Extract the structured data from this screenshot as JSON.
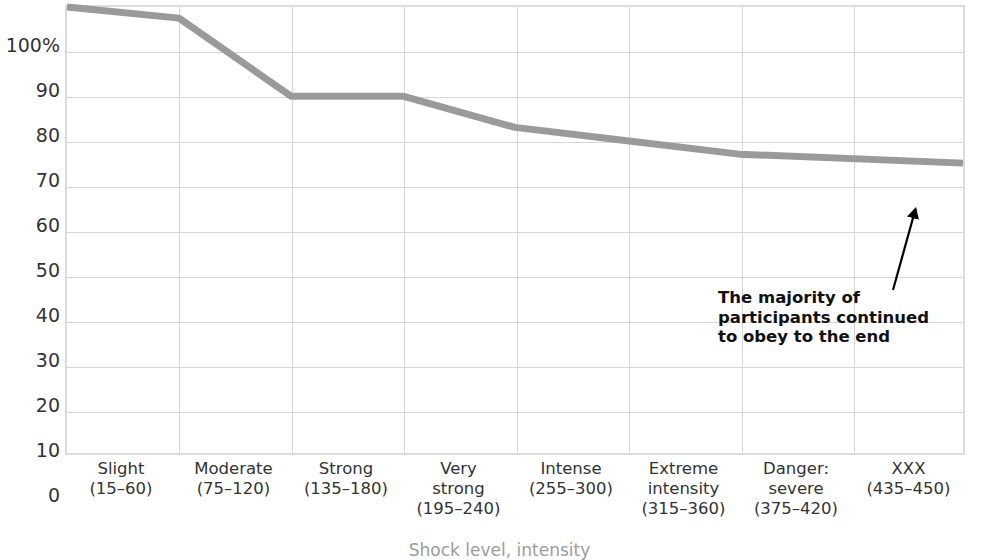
{
  "chart_data": {
    "type": "line",
    "title": "",
    "xlabel": "Shock level, intensity",
    "ylabel": "",
    "grid": true,
    "legend": "none",
    "ylim": [
      0,
      100
    ],
    "yticks": [
      "0",
      "10",
      "20",
      "30",
      "40",
      "50",
      "60",
      "70",
      "80",
      "90",
      "100%"
    ],
    "ytick_values": [
      0,
      10,
      20,
      30,
      40,
      50,
      60,
      70,
      80,
      90,
      100
    ],
    "categories": [
      "Slight (15–60)",
      "Moderate (75–120)",
      "Strong (135–180)",
      "Very strong (195–240)",
      "Intense (255–300)",
      "Extreme intensity (315–360)",
      "Danger: severe (375–420)",
      "XXX (435–450)"
    ],
    "category_lines": [
      [
        "Slight",
        "(15–60)"
      ],
      [
        "Moderate",
        "(75–120)"
      ],
      [
        "Strong",
        "(135–180)"
      ],
      [
        "Very",
        "strong",
        "(195–240)"
      ],
      [
        "Intense",
        "(255–300)"
      ],
      [
        "Extreme",
        "intensity",
        "(315–360)"
      ],
      [
        "Danger:",
        "severe",
        "(375–420)"
      ],
      [
        "XXX",
        "(435–450)"
      ]
    ],
    "values": [
      100,
      97.5,
      80,
      80,
      73,
      70,
      67,
      65
    ],
    "series": [
      {
        "name": "Participants still obeying",
        "values": [
          100,
          97.5,
          80,
          80,
          73,
          70,
          67,
          65
        ]
      }
    ],
    "annotations": [
      {
        "lines": [
          "The majority of",
          "participants continued",
          "to obey to the end"
        ],
        "points_to_value": 65,
        "points_to_category": "XXX (435–450)"
      }
    ],
    "colors": {
      "line": "#9a9a9a",
      "grid": "#d6d6d6",
      "border": "#dcdcdc",
      "text": "#333333",
      "annotation_text": "#111111",
      "arrow": "#000000",
      "background": "#ffffff"
    }
  }
}
